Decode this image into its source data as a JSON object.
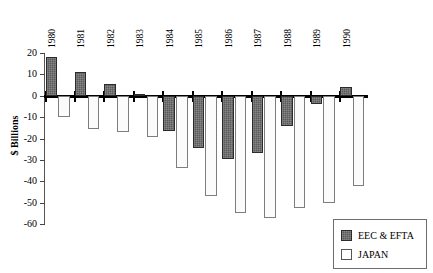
{
  "chart_data": {
    "type": "bar",
    "title": "",
    "subtitle": "",
    "xlabel": "",
    "ylabel": "$ Billions",
    "categories": [
      "1980",
      "1981",
      "1982",
      "1983",
      "1984",
      "1985",
      "1986",
      "1987",
      "1988",
      "1989",
      "1990"
    ],
    "series": [
      {
        "name": "EEC & EFTA",
        "color": "#5a5a5a",
        "values": [
          18,
          11,
          5.5,
          1,
          -16.5,
          -24.5,
          -29.5,
          -27,
          -14,
          -4,
          4
        ]
      },
      {
        "name": "JAPAN",
        "color": "#fbfbfb",
        "values": [
          -10,
          -15.5,
          -17,
          -19.5,
          -34,
          -47,
          -55,
          -57,
          -52.5,
          -50,
          -42
        ]
      }
    ],
    "ylim": [
      -60,
      20
    ],
    "yticks": [
      20,
      10,
      0,
      -10,
      -20,
      -30,
      -40,
      -50,
      -60
    ],
    "ytick_labels": [
      "20",
      "10",
      "0",
      "-10",
      "-20",
      "-30",
      "-40",
      "-50",
      "-60"
    ],
    "grid": false,
    "legend_position": "bottom-right",
    "zero_line": 0
  },
  "legend": {
    "items": [
      {
        "label": "EEC & EFTA",
        "swatch": "eec"
      },
      {
        "label": "JAPAN",
        "swatch": "japan"
      }
    ]
  }
}
